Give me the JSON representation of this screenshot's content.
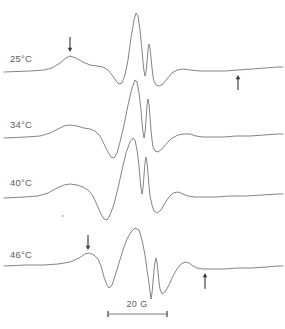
{
  "figure": {
    "type": "epr-derivative-spectra-stack",
    "width": 285,
    "height": 329,
    "background_color": "#ffffff",
    "trace_color": "#6e6e72",
    "label_color": "#5d5d62",
    "arrow_color": "#3a3a3f"
  },
  "traces": [
    {
      "id": "trace-25c",
      "label": "25°C",
      "label_x": 10,
      "label_y": 62,
      "baseline_y": 71,
      "path": "M 4,72 L 30,71 L 44,70 L 52,68 L 60,63 L 66,58 L 70,56 L 76,58 L 83,62 L 90,65 L 97,66 L 103,67 L 108,70 L 112,75 L 116,81 L 119,84 L 122,83 L 125,75 L 128,60 L 131,38 L 134,20 L 136,13 L 138,16 L 140,30 L 142,50 L 143,62 L 144,71 L 145,76 L 146,72 L 147,62 L 148,50 L 149,44 L 150,48 L 151,58 L 152,68 L 153,76 L 154,81 L 156,85 L 159,86 L 163,84 L 167,79 L 172,73 L 177,70 L 183,69 L 190,70 L 200,71 L 212,71 L 225,71 L 238,70 L 252,69 L 265,68 L 278,67 L 283,67"
    },
    {
      "id": "trace-34c",
      "label": "34°C",
      "label_x": 10,
      "label_y": 128,
      "baseline_y": 137,
      "path": "M 4,138 L 26,137 L 40,136 L 50,133 L 58,129 L 64,126 L 70,125 L 77,126 L 84,128 L 90,129 L 95,131 L 100,136 L 104,144 L 108,152 L 111,157 L 114,158 L 117,153 L 120,142 L 124,125 L 128,105 L 132,88 L 135,80 L 137,82 L 139,93 L 141,110 L 142,122 L 143,132 L 144,138 L 145,133 L 146,120 L 147,106 L 148,99 L 149,104 L 150,117 L 151,130 L 152,140 L 153,147 L 155,151 L 158,152 L 162,149 L 167,143 L 172,138 L 178,135 L 184,134 L 190,134 L 196,136 L 203,137 L 212,137 L 224,137 L 236,136 L 250,136 L 264,135 L 278,134 L 283,134"
    },
    {
      "id": "trace-40c",
      "label": "40°C",
      "label_x": 10,
      "label_y": 186,
      "baseline_y": 196,
      "path": "M 4,198 L 24,197 L 38,196 L 48,193 L 57,188 L 64,185 L 70,184 L 77,185 L 83,187 L 88,190 L 93,196 L 97,205 L 101,214 L 104,219 L 107,220 L 110,215 L 114,204 L 118,188 L 122,170 L 126,153 L 130,142 L 133,138 L 135,140 L 137,150 L 139,166 L 140,178 L 141,188 L 142,194 L 143,188 L 144,175 L 145,163 L 146,157 L 147,162 L 148,174 L 149,186 L 150,196 L 152,205 L 154,211 L 157,213 L 161,210 L 165,203 L 169,197 L 173,193 L 178,192 L 183,194 L 188,196 L 195,197 L 204,197 L 216,197 L 230,196 L 246,196 L 262,195 L 278,194 L 283,194"
    },
    {
      "id": "trace-46c",
      "label": "46°C",
      "label_x": 10,
      "label_y": 258,
      "baseline_y": 264,
      "path": "M 4,266 L 26,265 L 44,265 L 58,264 L 70,262 L 79,258 L 85,254 L 89,253 L 94,255 L 98,259 L 101,266 L 104,277 L 107,285 L 109,288 L 112,285 L 115,276 L 119,263 L 123,250 L 127,239 L 131,232 L 135,228 L 139,230 L 142,240 L 145,255 L 147,270 L 149,283 L 150,292 L 151,299 L 152,293 L 153,282 L 154,270 L 155,262 L 156,258 L 157,262 L 158,272 L 159,282 L 160,289 L 162,294 L 165,292 L 169,285 L 173,276 L 177,269 L 181,264 L 185,262 L 189,263 L 193,266 L 197,268 L 203,269 L 212,269 L 224,269 L 238,268 L 252,268 L 266,267 L 278,266 L 283,266"
    }
  ],
  "arrows": [
    {
      "id": "arrow-25c-left",
      "direction": "down",
      "x": 70,
      "y_tip": 52,
      "length": 15,
      "trace": "25°C"
    },
    {
      "id": "arrow-25c-right",
      "direction": "up",
      "x": 238,
      "y_tip": 75,
      "length": 15,
      "trace": "25°C"
    },
    {
      "id": "arrow-46c-left",
      "direction": "down",
      "x": 88,
      "y_tip": 250,
      "length": 15,
      "trace": "46°C"
    },
    {
      "id": "arrow-46c-right",
      "direction": "up",
      "x": 205,
      "y_tip": 273,
      "length": 16,
      "trace": "46°C"
    }
  ],
  "scale_bar": {
    "label": "20 G",
    "label_x": 137,
    "label_y": 307,
    "x_start": 108,
    "x_end": 167,
    "y": 314,
    "cap_half_height": 3
  },
  "artifacts": [
    {
      "id": "speck-1",
      "x": 63,
      "y": 216,
      "r": 1.2
    }
  ],
  "chart_data": {
    "type": "line",
    "title": "",
    "xlabel": "Magnetic field",
    "ylabel": "dX\"/dB (first derivative absorption)",
    "legend_position": "inline-left",
    "grid": false,
    "scale_bar": "20 G",
    "series": [
      {
        "name": "25°C",
        "label": "25°C"
      },
      {
        "name": "34°C",
        "label": "34°C"
      },
      {
        "name": "40°C",
        "label": "40°C"
      },
      {
        "name": "46°C",
        "label": "46°C"
      }
    ],
    "annotations": [
      {
        "series": "25°C",
        "marker": "arrow-down",
        "position": "low-field outer extremum"
      },
      {
        "series": "25°C",
        "marker": "arrow-up",
        "position": "high-field outer extremum"
      },
      {
        "series": "46°C",
        "marker": "arrow-down",
        "position": "low-field outer extremum"
      },
      {
        "series": "46°C",
        "marker": "arrow-up",
        "position": "high-field outer extremum"
      }
    ]
  }
}
